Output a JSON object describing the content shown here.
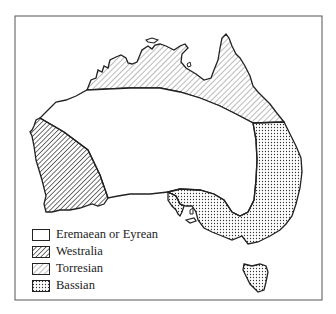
{
  "map": {
    "subject": "Australia faunal/biogeographic subregions",
    "colors": {
      "outline": "#222222",
      "background": "#ffffff",
      "frame": "#555555"
    },
    "regions": [
      {
        "id": "eremaean",
        "pattern": "blank"
      },
      {
        "id": "westralia",
        "pattern": "dense-hatch"
      },
      {
        "id": "torresian",
        "pattern": "light-hatch"
      },
      {
        "id": "bassian",
        "pattern": "dots"
      }
    ]
  },
  "legend": {
    "items": [
      {
        "label": "Eremaean or Eyrean",
        "pattern": "blank"
      },
      {
        "label": "Westralia",
        "pattern": "dense-hatch"
      },
      {
        "label": "Torresian",
        "pattern": "light-hatch"
      },
      {
        "label": "Bassian",
        "pattern": "dots"
      }
    ]
  }
}
